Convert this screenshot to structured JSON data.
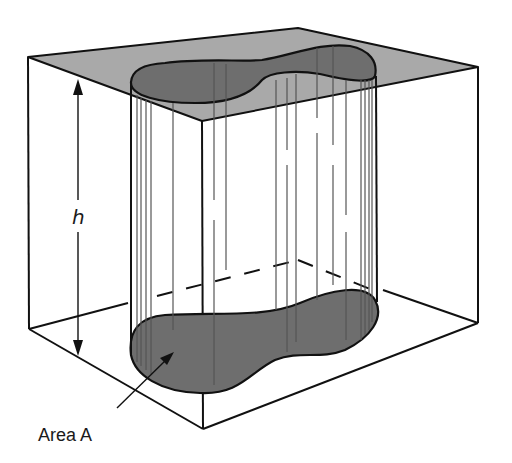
{
  "figure": {
    "labels": {
      "height": "h",
      "area": "Area A"
    },
    "colors": {
      "top_plane": "#a9a9a9",
      "cross_section": "#6e6e6e",
      "outline": "#111111",
      "hatch": "#555555",
      "background": "#ffffff"
    }
  }
}
